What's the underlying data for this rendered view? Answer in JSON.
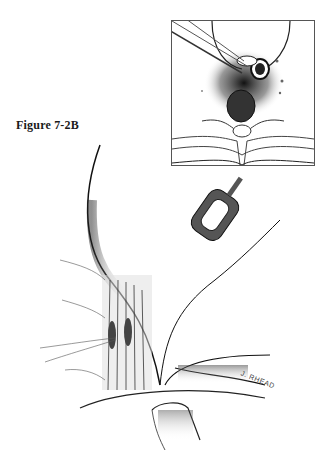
{
  "figure": {
    "caption": "Figure 7-2B",
    "artist_signature": "J. RHEAD",
    "inset_description": "cross-section-spine-with-retractor-instruments",
    "main_description": "surgical-exposure-illustration-with-retractor"
  },
  "colors": {
    "ink": "#1a1a1a",
    "shade": "#555555",
    "background": "#ffffff"
  }
}
